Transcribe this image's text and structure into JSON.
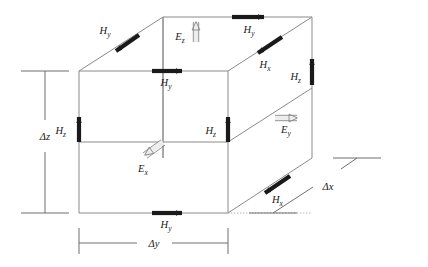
{
  "figure": {
    "background_color": "#ffffff",
    "edge_color": "#8a8a8a",
    "h_arrow_color": "#1a1a1a",
    "e_arrow_fill": "#ededed",
    "e_arrow_stroke": "#8a8a8a",
    "text_color": "#1a1a1a"
  },
  "dimensions": [
    {
      "id": "dz",
      "symbol": "Δ",
      "variable": "z",
      "label": "Δz",
      "orientation": "vertical",
      "position": "left"
    },
    {
      "id": "dy",
      "symbol": "Δ",
      "variable": "y",
      "label": "Δy",
      "orientation": "horizontal",
      "position": "bottom"
    },
    {
      "id": "dx",
      "symbol": "Δ",
      "variable": "x",
      "label": "Δx",
      "orientation": "diagonal",
      "position": "bottom-right"
    }
  ],
  "magnetic_fields": [
    {
      "id": "hy-top-back-left",
      "base": "H",
      "sub": "y",
      "label": "Hy",
      "direction": "down-left",
      "face": "top"
    },
    {
      "id": "hy-top-back-right",
      "base": "H",
      "sub": "y",
      "label": "Hy",
      "direction": "right",
      "face": "top"
    },
    {
      "id": "hy-top-front-mid",
      "base": "H",
      "sub": "y",
      "label": "Hy",
      "direction": "right",
      "face": "top-front-edge"
    },
    {
      "id": "hx-top-right",
      "base": "H",
      "sub": "x",
      "label": "Hx",
      "direction": "down-left",
      "face": "top-right-edge"
    },
    {
      "id": "hz-left",
      "base": "H",
      "sub": "z",
      "label": "Hz",
      "direction": "up",
      "face": "front-left-edge"
    },
    {
      "id": "hz-mid",
      "base": "H",
      "sub": "z",
      "label": "Hz",
      "direction": "up",
      "face": "front-right-edge"
    },
    {
      "id": "hz-right",
      "base": "H",
      "sub": "z",
      "label": "Hz",
      "direction": "up",
      "face": "back-right-edge"
    },
    {
      "id": "hy-bottom-front",
      "base": "H",
      "sub": "y",
      "label": "Hy",
      "direction": "right",
      "face": "bottom-front-edge"
    },
    {
      "id": "hx-bottom-right",
      "base": "H",
      "sub": "x",
      "label": "Hx",
      "direction": "down-left",
      "face": "bottom-right-edge"
    }
  ],
  "electric_fields": [
    {
      "id": "ez-top",
      "base": "E",
      "sub": "z",
      "label": "Ez",
      "direction": "up",
      "face": "top"
    },
    {
      "id": "ex-center",
      "base": "E",
      "sub": "x",
      "label": "Ex",
      "direction": "down-left",
      "face": "center"
    },
    {
      "id": "ey-right",
      "base": "E",
      "sub": "y",
      "label": "Ey",
      "direction": "right",
      "face": "right"
    }
  ]
}
